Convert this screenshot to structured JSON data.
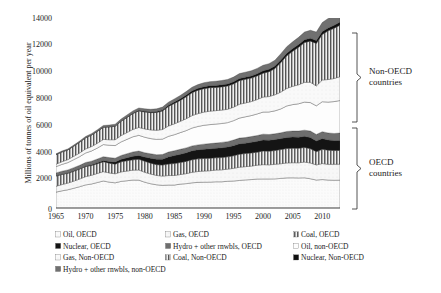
{
  "chart_data": {
    "type": "area",
    "title": "",
    "subtitle": "",
    "xlabel": "",
    "ylabel": "Millions of tonnes of oil equivalent per year",
    "xlim": [
      1965,
      2013
    ],
    "ylim": [
      0,
      14000
    ],
    "ytick_labels": [
      "0",
      "2000",
      "4000",
      "6000",
      "8000",
      "10000",
      "12000",
      "14000"
    ],
    "ytick_values": [
      0,
      2000,
      4000,
      6000,
      8000,
      10000,
      12000,
      14000
    ],
    "xtick_labels": [
      "1965",
      "1970",
      "1975",
      "1980",
      "1985",
      "1990",
      "1995",
      "2000",
      "2005",
      "2010"
    ],
    "xtick_values": [
      1965,
      1970,
      1975,
      1980,
      1985,
      1990,
      1995,
      2000,
      2005,
      2010
    ],
    "grid": false,
    "legend_position": "bottom",
    "stacked": true,
    "x": [
      1965,
      1966,
      1967,
      1968,
      1969,
      1970,
      1971,
      1972,
      1973,
      1974,
      1975,
      1976,
      1977,
      1978,
      1979,
      1980,
      1981,
      1982,
      1983,
      1984,
      1985,
      1986,
      1987,
      1988,
      1989,
      1990,
      1991,
      1992,
      1993,
      1994,
      1995,
      1996,
      1997,
      1998,
      1999,
      2000,
      2001,
      2002,
      2003,
      2004,
      2005,
      2006,
      2007,
      2008,
      2009,
      2010,
      2011,
      2012,
      2013
    ],
    "series": [
      {
        "name": "Oil, OECD",
        "fill": "dotted-light",
        "color": "#f2f2f2",
        "values": [
          1170,
          1265,
          1345,
          1455,
          1570,
          1700,
          1770,
          1880,
          1990,
          1905,
          1855,
          1960,
          2010,
          2060,
          2055,
          1900,
          1790,
          1710,
          1670,
          1690,
          1690,
          1760,
          1795,
          1855,
          1890,
          1900,
          1905,
          1930,
          1930,
          1970,
          1990,
          2030,
          2070,
          2095,
          2135,
          2140,
          2140,
          2145,
          2180,
          2220,
          2225,
          2215,
          2225,
          2155,
          2060,
          2095,
          2060,
          2045,
          2050
        ]
      },
      {
        "name": "Gas, OECD",
        "fill": "dotted-sparse",
        "color": "#ebebeb",
        "values": [
          430,
          460,
          490,
          525,
          565,
          610,
          640,
          665,
          690,
          680,
          665,
          700,
          710,
          730,
          745,
          730,
          710,
          690,
          680,
          700,
          705,
          705,
          735,
          775,
          800,
          820,
          840,
          865,
          880,
          895,
          930,
          975,
          975,
          990,
          1020,
          1055,
          1040,
          1075,
          1080,
          1100,
          1110,
          1115,
          1160,
          1160,
          1115,
          1180,
          1155,
          1175,
          1180
        ]
      },
      {
        "name": "Coal, OECD",
        "fill": "vstripe",
        "color": "#7a7a7a",
        "values": [
          760,
          750,
          720,
          730,
          730,
          745,
          720,
          720,
          730,
          720,
          710,
          740,
          760,
          760,
          790,
          810,
          800,
          795,
          810,
          855,
          880,
          885,
          905,
          925,
          930,
          930,
          915,
          905,
          905,
          905,
          925,
          955,
          965,
          970,
          960,
          1000,
          1010,
          1010,
          1045,
          1060,
          1065,
          1065,
          1075,
          1060,
          975,
          1045,
          1045,
          1010,
          1015
        ]
      },
      {
        "name": "Nuclear, OECD",
        "fill": "solid-dark",
        "color": "#141414",
        "values": [
          12,
          16,
          20,
          26,
          34,
          42,
          58,
          76,
          95,
          120,
          155,
          185,
          225,
          265,
          285,
          310,
          370,
          400,
          440,
          520,
          590,
          610,
          630,
          660,
          670,
          680,
          700,
          705,
          720,
          725,
          750,
          770,
          765,
          785,
          800,
          810,
          805,
          815,
          810,
          820,
          830,
          825,
          820,
          815,
          790,
          800,
          755,
          735,
          730
        ]
      },
      {
        "name": "Hydro + other rnwbls, OECD",
        "fill": "solid-mid",
        "color": "#6e6e6e",
        "values": [
          215,
          220,
          230,
          238,
          246,
          255,
          262,
          270,
          278,
          290,
          285,
          285,
          295,
          315,
          320,
          325,
          325,
          330,
          345,
          355,
          355,
          365,
          365,
          360,
          360,
          375,
          385,
          380,
          400,
          395,
          410,
          420,
          415,
          425,
          425,
          435,
          420,
          425,
          425,
          440,
          440,
          450,
          455,
          475,
          480,
          500,
          515,
          525,
          545
        ]
      },
      {
        "name": "Oil, non-OECD",
        "fill": "white-plain",
        "color": "#fdfdfd",
        "values": [
          460,
          500,
          540,
          590,
          640,
          700,
          750,
          810,
          890,
          910,
          930,
          1000,
          1060,
          1120,
          1160,
          1140,
          1120,
          1130,
          1130,
          1160,
          1180,
          1230,
          1270,
          1320,
          1360,
          1390,
          1400,
          1400,
          1390,
          1400,
          1430,
          1475,
          1530,
          1545,
          1590,
          1630,
          1660,
          1690,
          1760,
          1880,
          1950,
          2010,
          2070,
          2100,
          2110,
          2210,
          2275,
          2350,
          2400
        ]
      },
      {
        "name": "Gas, Non-OECD",
        "fill": "dotted-sparse2",
        "color": "#f0f0f0",
        "values": [
          180,
          200,
          220,
          245,
          270,
          300,
          325,
          350,
          380,
          405,
          430,
          465,
          500,
          540,
          580,
          610,
          640,
          670,
          710,
          760,
          800,
          830,
          875,
          915,
          945,
          970,
          990,
          990,
          990,
          985,
          990,
          1020,
          1020,
          1030,
          1060,
          1105,
          1135,
          1180,
          1240,
          1290,
          1345,
          1400,
          1455,
          1500,
          1465,
          1600,
          1660,
          1700,
          1755
        ]
      },
      {
        "name": "Coal, Non-OECD",
        "fill": "vstripe2",
        "color": "#6b6b6b",
        "values": [
          700,
          720,
          715,
          745,
          790,
          820,
          845,
          875,
          900,
          940,
          990,
          1050,
          1110,
          1165,
          1220,
          1250,
          1270,
          1315,
          1365,
          1440,
          1500,
          1545,
          1620,
          1690,
          1720,
          1730,
          1730,
          1710,
          1710,
          1715,
          1720,
          1740,
          1740,
          1730,
          1740,
          1760,
          1830,
          1930,
          2180,
          2400,
          2580,
          2760,
          2930,
          3030,
          3130,
          3350,
          3590,
          3700,
          3800
        ]
      },
      {
        "name": "Nuclear, Non-OECD",
        "fill": "solid-dark2",
        "color": "#101010",
        "values": [
          2,
          3,
          4,
          5,
          7,
          9,
          11,
          14,
          17,
          21,
          26,
          31,
          37,
          44,
          50,
          55,
          62,
          70,
          80,
          92,
          105,
          115,
          125,
          135,
          142,
          148,
          150,
          150,
          152,
          155,
          158,
          162,
          160,
          162,
          168,
          175,
          180,
          185,
          190,
          196,
          200,
          205,
          210,
          212,
          215,
          222,
          215,
          218,
          225
        ]
      },
      {
        "name": "Hydro + other rnwbls, non-OECD",
        "fill": "solid-mid2",
        "color": "#707070",
        "values": [
          60,
          65,
          70,
          76,
          82,
          90,
          96,
          103,
          110,
          120,
          128,
          136,
          145,
          155,
          165,
          175,
          185,
          195,
          205,
          220,
          232,
          243,
          255,
          266,
          276,
          288,
          296,
          305,
          318,
          328,
          342,
          356,
          366,
          376,
          390,
          405,
          415,
          432,
          455,
          480,
          500,
          530,
          560,
          590,
          620,
          660,
          700,
          730,
          770
        ]
      }
    ],
    "annotations": [
      {
        "name": "non-oecd-bracket",
        "text": "Non-OECD\ncountries",
        "line1": "Non-OECD",
        "line2": "countries"
      },
      {
        "name": "oecd-bracket",
        "text": "OECD\ncountries",
        "line1": "OECD",
        "line2": "countries"
      }
    ]
  },
  "axis": {
    "ylabel": "Millions of tonnes of oil equivalent per year",
    "yticks": [
      "14000",
      "12000",
      "10000",
      "8000",
      "6000",
      "4000",
      "2000",
      "0"
    ],
    "xticks": [
      "1965",
      "1970",
      "1975",
      "1980",
      "1985",
      "1990",
      "1995",
      "2000",
      "2005",
      "2010"
    ]
  },
  "brackets": {
    "non_oecd_line1": "Non-OECD",
    "non_oecd_line2": "countries",
    "oecd_line1": "OECD",
    "oecd_line2": "countries"
  },
  "legend": {
    "items": [
      {
        "label": "Oil, OECD",
        "swatch": "dotted-light"
      },
      {
        "label": "Gas, OECD",
        "swatch": "dotted-sparse"
      },
      {
        "label": "Coal, OECD",
        "swatch": "vstripe"
      },
      {
        "label": "Nuclear, OECD",
        "swatch": "solid-dark"
      },
      {
        "label": "Hydro + other rnwbls, OECD",
        "swatch": "solid-mid"
      },
      {
        "label": "Oil, non-OECD",
        "swatch": "white-plain"
      },
      {
        "label": "Gas, Non-OECD",
        "swatch": "dotted-sparse2"
      },
      {
        "label": "Coal, Non-OECD",
        "swatch": "vstripe2"
      },
      {
        "label": "Nuclear, Non-OECD",
        "swatch": "solid-dark2"
      },
      {
        "label": "Hydro + other rnwbls, non-OECD",
        "swatch": "solid-mid2"
      }
    ]
  }
}
